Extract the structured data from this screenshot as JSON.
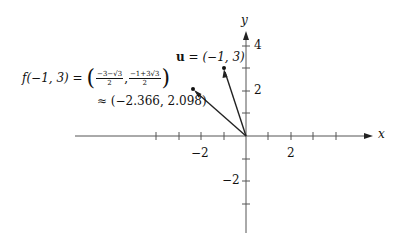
{
  "diagram": {
    "axes": {
      "x_label": "x",
      "y_label": "y",
      "x_tick_labels": [
        {
          "value": -2,
          "text": "−2"
        },
        {
          "value": 2,
          "text": "2"
        }
      ],
      "y_tick_labels": [
        {
          "value": 4,
          "text": "4"
        },
        {
          "value": 2,
          "text": "2"
        },
        {
          "value": -2,
          "text": "−2"
        }
      ],
      "x_range": [
        -7.5,
        5.6
      ],
      "y_range": [
        -4.3,
        4.6
      ]
    },
    "vectors": [
      {
        "name": "u",
        "x": -1,
        "y": 3,
        "label_bold": "u",
        "label_rest": " = (−1, 3)"
      },
      {
        "name": "f(-1,3)",
        "x": -2.366,
        "y": 2.098
      }
    ],
    "f_label": {
      "lhs": "f(−1, 3) = ",
      "frac1_num": "−3−√3",
      "frac1_den": "2",
      "sep": ",",
      "frac2_num": "−1+3√3",
      "frac2_den": "2",
      "approx": "≈ (−2.366, 2.098)"
    },
    "colors": {
      "axis": "#555555",
      "vector": "#222222"
    }
  }
}
